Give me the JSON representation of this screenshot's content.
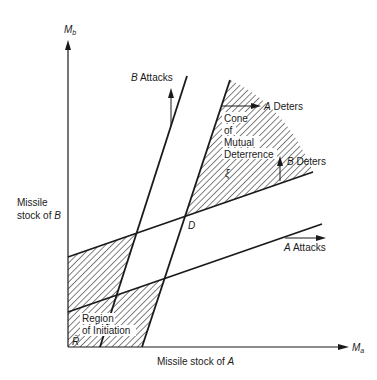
{
  "axes": {
    "y_label": "M",
    "y_sub": "b",
    "x_label": "M",
    "x_sub": "a",
    "y_title_line1": "Missile",
    "y_title_line2": "stock of ",
    "y_title_var": "B",
    "x_title": "Missile stock of ",
    "x_title_var": "A"
  },
  "annotations": {
    "b_attacks_var": "B",
    "b_attacks_text": " Attacks",
    "a_deters_var": "A",
    "a_deters_text": " Deters",
    "b_deters_var": "B",
    "b_deters_text": " Deters",
    "a_attacks_var": "A",
    "a_attacks_text": " Attacks",
    "cone_line1": "Cone",
    "cone_line2": "of",
    "cone_line3": "Mutual",
    "cone_line4": "Deterrence",
    "cone_symbol": "ξ",
    "region_line1": "Region",
    "region_line2": "of Initiation",
    "region_symbol": "R̄",
    "point_d": "D"
  },
  "colors": {
    "ink": "#1a1a1a",
    "background": "#ffffff"
  }
}
